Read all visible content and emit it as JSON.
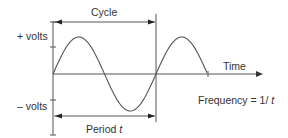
{
  "diagram": {
    "labels": {
      "cycle": "Cycle",
      "plus_volts": "+ volts",
      "minus_volts": "– volts",
      "time": "Time",
      "period": "Period ",
      "period_var": "t",
      "frequency": "Frequency = 1/ ",
      "frequency_var": "t"
    },
    "wave": {
      "cycles_shown": 1.5,
      "shape": "sine"
    },
    "colors": {
      "line": "#555555",
      "text": "#333333"
    }
  }
}
